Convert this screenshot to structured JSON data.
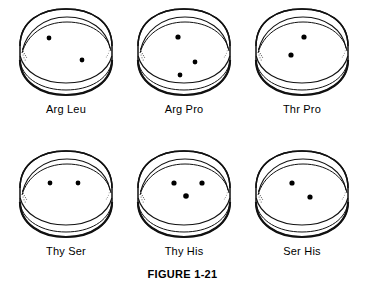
{
  "figure": {
    "caption": "FIGURE 1-21",
    "ink_color": "#111111",
    "background_color": "#ffffff",
    "colony_color": "#000000",
    "rows": 2,
    "columns": 3
  },
  "dishes": [
    {
      "label": "Arg Leu",
      "colony_count": 2,
      "colonies": [
        {
          "cx": 39,
          "cy": 34,
          "r": 2.4
        },
        {
          "cx": 72,
          "cy": 56,
          "r": 2.4
        }
      ]
    },
    {
      "label": "Arg Pro",
      "colony_count": 3,
      "colonies": [
        {
          "cx": 50,
          "cy": 33,
          "r": 2.6
        },
        {
          "cx": 67,
          "cy": 58,
          "r": 2.4
        },
        {
          "cx": 52,
          "cy": 71,
          "r": 2.4
        }
      ]
    },
    {
      "label": "Thr Pro",
      "colony_count": 2,
      "colonies": [
        {
          "cx": 58,
          "cy": 33,
          "r": 2.6
        },
        {
          "cx": 45,
          "cy": 51,
          "r": 2.6
        }
      ]
    },
    {
      "label": "Thy Ser",
      "colony_count": 2,
      "colonies": [
        {
          "cx": 40,
          "cy": 37,
          "r": 2.4
        },
        {
          "cx": 68,
          "cy": 37,
          "r": 2.4
        }
      ]
    },
    {
      "label": "Thy His",
      "colony_count": 3,
      "colonies": [
        {
          "cx": 46,
          "cy": 37,
          "r": 2.6
        },
        {
          "cx": 74,
          "cy": 37,
          "r": 2.6
        },
        {
          "cx": 58,
          "cy": 50,
          "r": 2.8
        }
      ]
    },
    {
      "label": "Ser His",
      "colony_count": 2,
      "colonies": [
        {
          "cx": 46,
          "cy": 37,
          "r": 2.6
        },
        {
          "cx": 64,
          "cy": 51,
          "r": 2.6
        }
      ]
    }
  ]
}
